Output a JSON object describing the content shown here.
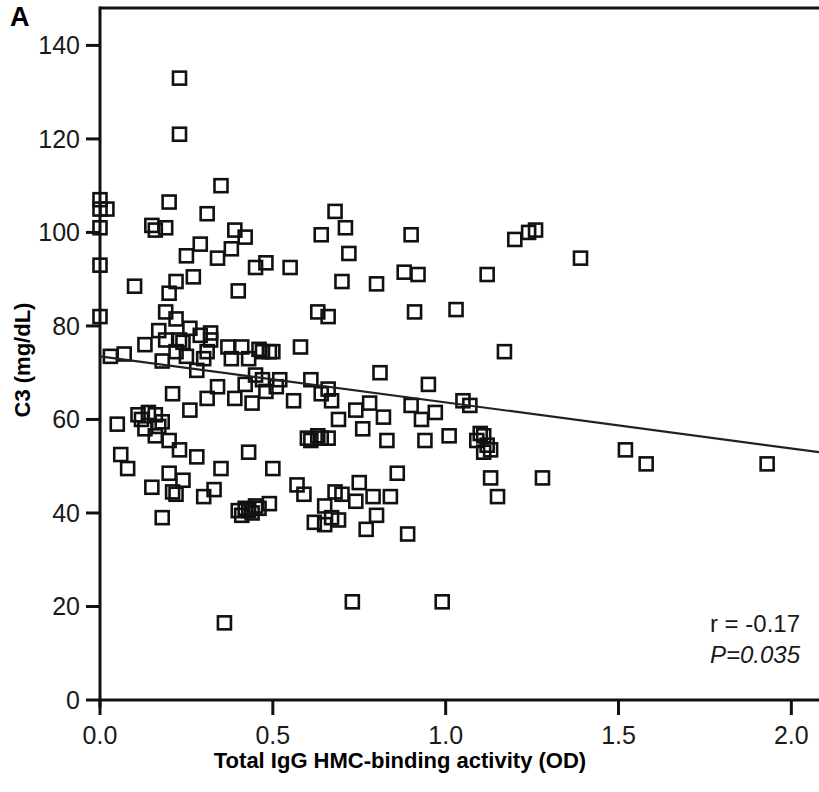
{
  "panel": {
    "label": "A"
  },
  "annotations": {
    "r_label": "r = -0.17",
    "p_label": "P=0.035"
  },
  "colors": {
    "axis": "#111111",
    "marker_stroke": "#111111",
    "regression": "#222222",
    "background": "#ffffff"
  },
  "chart_data": {
    "type": "scatter",
    "title": "",
    "subtitle": "",
    "xlabel": "Total IgG HMC-binding activity (OD)",
    "ylabel": "C3 (mg/dL)",
    "xlim": [
      0.0,
      2.08
    ],
    "ylim": [
      0,
      148
    ],
    "xticks": [
      0.0,
      0.5,
      1.0,
      1.5,
      2.0
    ],
    "xtick_labels": [
      "0.0",
      "0.5",
      "1.0",
      "1.5",
      "2.0"
    ],
    "yticks": [
      0,
      20,
      40,
      60,
      80,
      100,
      120,
      140
    ],
    "ytick_labels": [
      "0",
      "20",
      "40",
      "60",
      "80",
      "100",
      "120",
      "140"
    ],
    "grid": false,
    "legend": null,
    "marker": "open-square",
    "correlation_r": -0.17,
    "p_value": 0.035,
    "n_points": 184,
    "trendline": {
      "type": "linear",
      "x_start": 0.0,
      "y_start": 73.5,
      "x_end": 2.08,
      "y_end": 53.0
    },
    "points": [
      [
        0.0,
        107.0
      ],
      [
        0.0,
        105.0
      ],
      [
        0.0,
        101.0
      ],
      [
        0.0,
        93.0
      ],
      [
        0.0,
        82.0
      ],
      [
        0.02,
        105.0
      ],
      [
        0.03,
        73.5
      ],
      [
        0.05,
        59.0
      ],
      [
        0.06,
        52.5
      ],
      [
        0.07,
        74.0
      ],
      [
        0.08,
        49.5
      ],
      [
        0.1,
        88.5
      ],
      [
        0.11,
        61.0
      ],
      [
        0.12,
        60.0
      ],
      [
        0.13,
        76.0
      ],
      [
        0.13,
        58.0
      ],
      [
        0.14,
        61.5
      ],
      [
        0.15,
        45.5
      ],
      [
        0.15,
        101.5
      ],
      [
        0.16,
        100.5
      ],
      [
        0.16,
        61.0
      ],
      [
        0.16,
        56.5
      ],
      [
        0.17,
        79.0
      ],
      [
        0.17,
        58.5
      ],
      [
        0.18,
        72.5
      ],
      [
        0.18,
        59.5
      ],
      [
        0.18,
        39.0
      ],
      [
        0.19,
        101.0
      ],
      [
        0.19,
        83.0
      ],
      [
        0.19,
        77.0
      ],
      [
        0.2,
        106.5
      ],
      [
        0.2,
        87.0
      ],
      [
        0.2,
        55.5
      ],
      [
        0.2,
        48.5
      ],
      [
        0.21,
        44.5
      ],
      [
        0.21,
        65.5
      ],
      [
        0.22,
        89.5
      ],
      [
        0.22,
        81.5
      ],
      [
        0.22,
        74.5
      ],
      [
        0.22,
        44.0
      ],
      [
        0.23,
        133.0
      ],
      [
        0.23,
        121.0
      ],
      [
        0.23,
        77.0
      ],
      [
        0.23,
        53.5
      ],
      [
        0.24,
        76.5
      ],
      [
        0.24,
        47.0
      ],
      [
        0.25,
        95.0
      ],
      [
        0.25,
        73.5
      ],
      [
        0.26,
        79.5
      ],
      [
        0.26,
        62.0
      ],
      [
        0.27,
        90.5
      ],
      [
        0.28,
        70.5
      ],
      [
        0.28,
        52.0
      ],
      [
        0.29,
        97.5
      ],
      [
        0.29,
        78.0
      ],
      [
        0.3,
        73.0
      ],
      [
        0.3,
        43.5
      ],
      [
        0.31,
        104.0
      ],
      [
        0.31,
        74.5
      ],
      [
        0.31,
        64.5
      ],
      [
        0.32,
        78.5
      ],
      [
        0.32,
        77.0
      ],
      [
        0.33,
        45.0
      ],
      [
        0.34,
        94.5
      ],
      [
        0.34,
        67.0
      ],
      [
        0.35,
        110.0
      ],
      [
        0.35,
        49.5
      ],
      [
        0.36,
        16.5
      ],
      [
        0.37,
        75.5
      ],
      [
        0.38,
        96.5
      ],
      [
        0.38,
        73.0
      ],
      [
        0.39,
        100.5
      ],
      [
        0.39,
        64.5
      ],
      [
        0.4,
        87.5
      ],
      [
        0.4,
        40.5
      ],
      [
        0.41,
        39.5
      ],
      [
        0.41,
        75.5
      ],
      [
        0.42,
        99.0
      ],
      [
        0.42,
        67.5
      ],
      [
        0.42,
        41.0
      ],
      [
        0.43,
        73.0
      ],
      [
        0.43,
        53.0
      ],
      [
        0.43,
        40.5
      ],
      [
        0.44,
        63.5
      ],
      [
        0.44,
        40.0
      ],
      [
        0.45,
        92.5
      ],
      [
        0.45,
        69.5
      ],
      [
        0.45,
        41.5
      ],
      [
        0.46,
        75.0
      ],
      [
        0.46,
        41.0
      ],
      [
        0.47,
        68.5
      ],
      [
        0.47,
        74.5
      ],
      [
        0.48,
        93.5
      ],
      [
        0.48,
        66.0
      ],
      [
        0.49,
        74.5
      ],
      [
        0.49,
        42.0
      ],
      [
        0.5,
        74.5
      ],
      [
        0.5,
        49.5
      ],
      [
        0.51,
        67.0
      ],
      [
        0.52,
        68.5
      ],
      [
        0.55,
        92.5
      ],
      [
        0.56,
        64.0
      ],
      [
        0.57,
        46.0
      ],
      [
        0.58,
        75.5
      ],
      [
        0.59,
        44.0
      ],
      [
        0.6,
        56.0
      ],
      [
        0.61,
        68.5
      ],
      [
        0.61,
        55.5
      ],
      [
        0.62,
        38.0
      ],
      [
        0.63,
        83.0
      ],
      [
        0.63,
        56.5
      ],
      [
        0.64,
        99.5
      ],
      [
        0.64,
        65.5
      ],
      [
        0.64,
        56.0
      ],
      [
        0.65,
        41.5
      ],
      [
        0.65,
        37.5
      ],
      [
        0.66,
        82.0
      ],
      [
        0.66,
        66.5
      ],
      [
        0.66,
        56.0
      ],
      [
        0.67,
        64.0
      ],
      [
        0.67,
        39.0
      ],
      [
        0.68,
        104.5
      ],
      [
        0.68,
        44.5
      ],
      [
        0.69,
        60.0
      ],
      [
        0.69,
        38.5
      ],
      [
        0.7,
        89.5
      ],
      [
        0.7,
        44.0
      ],
      [
        0.71,
        101.0
      ],
      [
        0.72,
        95.5
      ],
      [
        0.73,
        21.0
      ],
      [
        0.74,
        62.0
      ],
      [
        0.74,
        42.5
      ],
      [
        0.75,
        46.5
      ],
      [
        0.76,
        58.0
      ],
      [
        0.77,
        36.5
      ],
      [
        0.78,
        63.5
      ],
      [
        0.79,
        43.5
      ],
      [
        0.8,
        89.0
      ],
      [
        0.8,
        39.5
      ],
      [
        0.81,
        70.0
      ],
      [
        0.82,
        60.5
      ],
      [
        0.83,
        55.5
      ],
      [
        0.84,
        43.5
      ],
      [
        0.86,
        48.5
      ],
      [
        0.88,
        91.5
      ],
      [
        0.89,
        35.5
      ],
      [
        0.9,
        99.5
      ],
      [
        0.9,
        63.0
      ],
      [
        0.91,
        83.0
      ],
      [
        0.92,
        91.0
      ],
      [
        0.93,
        60.0
      ],
      [
        0.94,
        55.5
      ],
      [
        0.95,
        67.5
      ],
      [
        0.97,
        61.5
      ],
      [
        0.99,
        21.0
      ],
      [
        1.01,
        56.5
      ],
      [
        1.03,
        83.5
      ],
      [
        1.05,
        64.0
      ],
      [
        1.07,
        63.0
      ],
      [
        1.09,
        55.5
      ],
      [
        1.1,
        57.0
      ],
      [
        1.11,
        56.5
      ],
      [
        1.11,
        53.0
      ],
      [
        1.12,
        91.0
      ],
      [
        1.12,
        54.5
      ],
      [
        1.13,
        53.5
      ],
      [
        1.13,
        47.5
      ],
      [
        1.15,
        43.5
      ],
      [
        1.17,
        74.5
      ],
      [
        1.2,
        98.5
      ],
      [
        1.24,
        100.0
      ],
      [
        1.26,
        100.5
      ],
      [
        1.28,
        47.5
      ],
      [
        1.39,
        94.5
      ],
      [
        1.52,
        53.5
      ],
      [
        1.58,
        50.5
      ],
      [
        1.93,
        50.5
      ]
    ]
  }
}
